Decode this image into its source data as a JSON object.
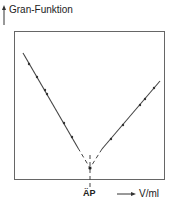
{
  "diagram": {
    "y_axis_label": "Gran-Funktion",
    "x_axis_label": "V/ml",
    "endpoint_label": "ÄP",
    "line_color": "#333333",
    "frame_color": "#555555"
  }
}
